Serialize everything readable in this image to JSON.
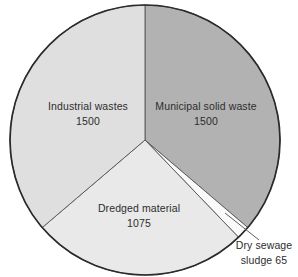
{
  "figure": {
    "background": "#ffffff"
  },
  "chart_data": {
    "type": "pie",
    "title": "",
    "total": 4140,
    "start_angle_deg": 0,
    "direction": "clockwise",
    "slices": [
      {
        "label": "Municipal solid waste",
        "value": 1500,
        "color": "#b2b2b2"
      },
      {
        "label": "Dry sewage sludge",
        "value": 65,
        "color": "#fafafa"
      },
      {
        "label": "Dredged material",
        "value": 1075,
        "color": "#e9e9e9"
      },
      {
        "label": "Industrial wastes",
        "value": 1500,
        "color": "#dfdfdf"
      }
    ],
    "labels_inside": [
      {
        "slice": "Industrial wastes",
        "line1": "Industrial wastes",
        "line2": "1500"
      },
      {
        "slice": "Municipal solid waste",
        "line1": "Municipal solid waste",
        "line2": "1500"
      },
      {
        "slice": "Dredged material",
        "line1": "Dredged material",
        "line2": "1075"
      }
    ],
    "label_outside": {
      "slice": "Dry sewage sludge",
      "line1": "Dry sewage",
      "line2": "sludge 65"
    },
    "legend": "none",
    "outline_color": "#2b2b2b",
    "divider_color": "#5f5f5f",
    "text_color": "#2d2d2d"
  }
}
